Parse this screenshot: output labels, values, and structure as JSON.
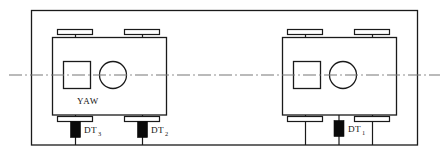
{
  "diagram": {
    "colors": {
      "line": "#1a1a1a",
      "sensor_fill": "#0a0a0a",
      "centerline": "#777777",
      "background": "#ffffff"
    },
    "centerline": {
      "name": "longitudinal-centerline",
      "style": "dash-dot"
    },
    "outer_frame": {
      "name": "outer-frame"
    },
    "bogies": [
      {
        "id": "left-bogie",
        "yaw_label": "YAW",
        "has_yaw_label": true,
        "components": {
          "body": "bogie-body",
          "yaw_sensor_box": "yaw-sensor-box",
          "yaw_sensor_circle": "yaw-sensor-circle",
          "wheels": [
            "wheel-front-left",
            "wheel-front-right",
            "wheel-rear-left",
            "wheel-rear-right"
          ]
        }
      },
      {
        "id": "right-bogie",
        "yaw_label": "",
        "has_yaw_label": false,
        "components": {
          "body": "bogie-body",
          "yaw_sensor_box": "yaw-sensor-box",
          "yaw_sensor_circle": "yaw-sensor-circle",
          "wheels": [
            "wheel-front-left",
            "wheel-front-right",
            "wheel-rear-left",
            "wheel-rear-right"
          ]
        }
      }
    ],
    "sensors": [
      {
        "id": "dt3",
        "label_base": "DT",
        "label_sub": "3",
        "full_label": "DT3",
        "position": "left-bogie-rear-left-wheel"
      },
      {
        "id": "dt2",
        "label_base": "DT",
        "label_sub": "2",
        "full_label": "DT2",
        "position": "left-bogie-rear-right-wheel"
      },
      {
        "id": "dt1",
        "label_base": "DT",
        "label_sub": "1",
        "full_label": "DT1",
        "position": "right-bogie-rear-center"
      }
    ]
  }
}
